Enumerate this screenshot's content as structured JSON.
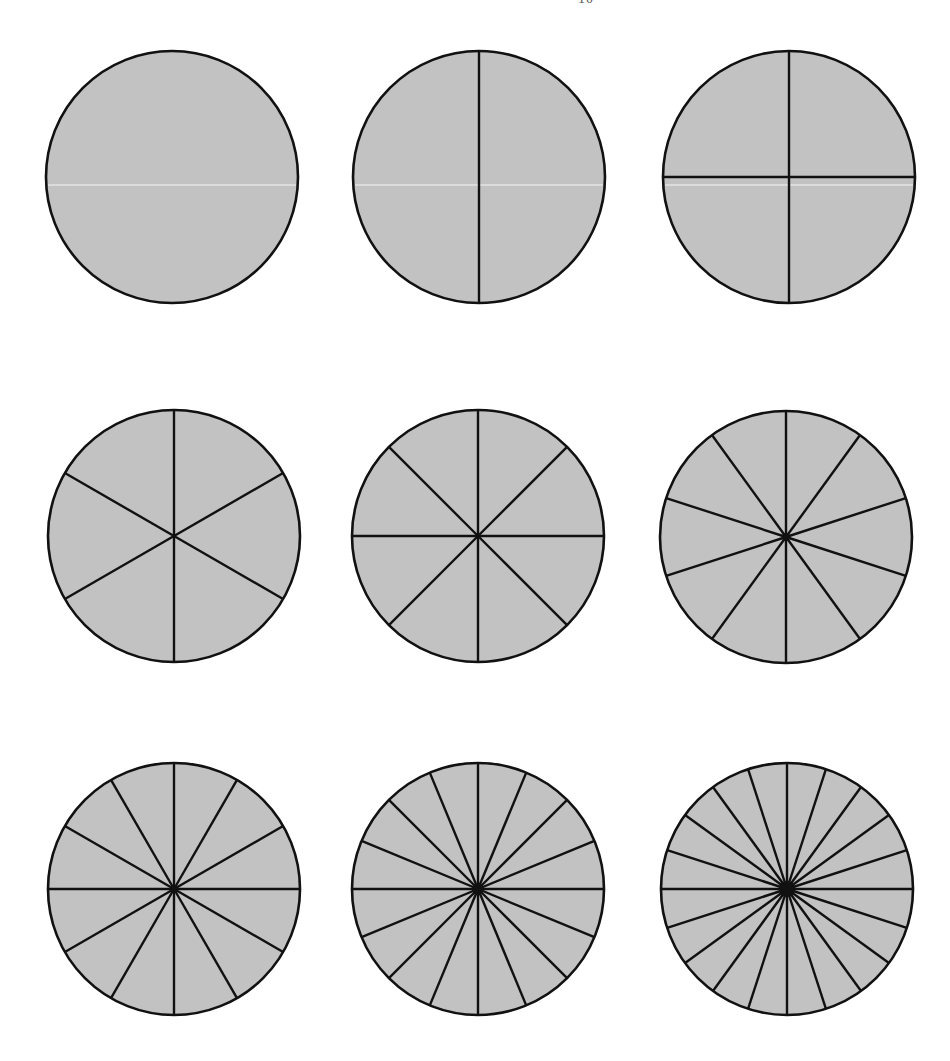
{
  "page": {
    "width": 950,
    "height": 1061,
    "background": "#ffffff",
    "page_number_fragment": "10"
  },
  "style": {
    "fill_color": "#c2c2c2",
    "stroke_color": "#111111",
    "border_width": 2.6,
    "divider_width": 2.4,
    "radius": 126
  },
  "fraction_circles": [
    {
      "id": "circle-whole",
      "parts": 1,
      "cx": 172,
      "cy": 177,
      "scan_line": true
    },
    {
      "id": "circle-halves",
      "parts": 2,
      "cx": 479,
      "cy": 177,
      "scan_line": true
    },
    {
      "id": "circle-quarters",
      "parts": 4,
      "cx": 789,
      "cy": 177,
      "scan_line": true
    },
    {
      "id": "circle-sixths",
      "parts": 6,
      "cx": 174,
      "cy": 536
    },
    {
      "id": "circle-eighths",
      "parts": 8,
      "cx": 478,
      "cy": 536
    },
    {
      "id": "circle-tenths",
      "parts": 10,
      "cx": 786,
      "cy": 537
    },
    {
      "id": "circle-twelfths",
      "parts": 12,
      "cx": 174,
      "cy": 889
    },
    {
      "id": "circle-sixteenths",
      "parts": 16,
      "cx": 478,
      "cy": 889
    },
    {
      "id": "circle-twentieths",
      "parts": 20,
      "cx": 787,
      "cy": 889
    }
  ]
}
